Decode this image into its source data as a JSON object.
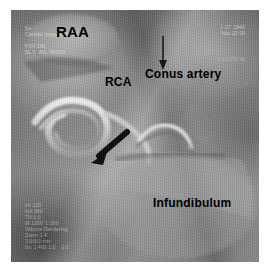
{
  "viewer": {
    "modality": "cardiac-ct-volume-rendering"
  },
  "annotations": {
    "raa": "RAA",
    "rca": "RCA",
    "conus_artery": "Conus artery",
    "infundibulum": "Infundibulum"
  },
  "overlay": {
    "top_left": "Se:\nCardiac Imaging  Ar 04\n\nFOV 180\nSL 5  W/L 380/50",
    "top_right": "1 27  1943\nNov 22 09",
    "middle_right": "3 1/2 252 W",
    "bottom_left": "kV 120\nmA 380\nTilt 0.0\nW 1200  L 300\nVolume Rendering\nZoom 1.4\n3.0/3.0 mm\nIm: 1 400 1.0    2.0"
  },
  "colors": {
    "background": "#ffffff",
    "image_mid": "#8d8d8d",
    "annotation": "#000000",
    "overlay_text": "#eeeeee"
  }
}
